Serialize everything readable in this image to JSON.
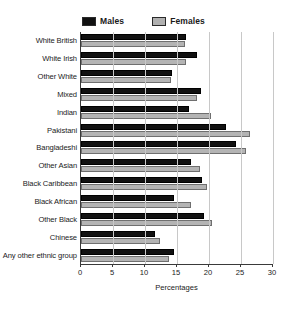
{
  "chart_data": {
    "type": "bar",
    "orientation": "horizontal",
    "title": "",
    "xlabel": "Percentages",
    "ylabel": "",
    "xlim": [
      0,
      30
    ],
    "xticks": [
      0,
      5,
      10,
      15,
      20,
      25,
      30
    ],
    "grid": true,
    "legend_position": "top",
    "categories": [
      "White British",
      "White Irish",
      "Other White",
      "Mixed",
      "Indian",
      "Pakistani",
      "Bangladeshi",
      "Other Asian",
      "Black Caribbean",
      "Black African",
      "Other Black",
      "Chinese",
      "Any other ethnic group"
    ],
    "series": [
      {
        "name": "Males",
        "color": "#111111",
        "values": [
          16.4,
          18.1,
          14.2,
          18.8,
          16.9,
          22.6,
          24.2,
          17.2,
          18.9,
          14.5,
          19.2,
          11.6,
          14.6
        ]
      },
      {
        "name": "Females",
        "color": "#b4b4b4",
        "values": [
          16.2,
          16.4,
          14.1,
          18.1,
          20.3,
          26.4,
          25.8,
          18.6,
          19.7,
          17.2,
          20.5,
          12.3,
          13.8
        ]
      }
    ]
  },
  "legend": {
    "items": [
      {
        "label": "Males",
        "color": "#111111"
      },
      {
        "label": "Females",
        "color": "#b4b4b4"
      }
    ]
  },
  "caption": {
    "text": ""
  }
}
